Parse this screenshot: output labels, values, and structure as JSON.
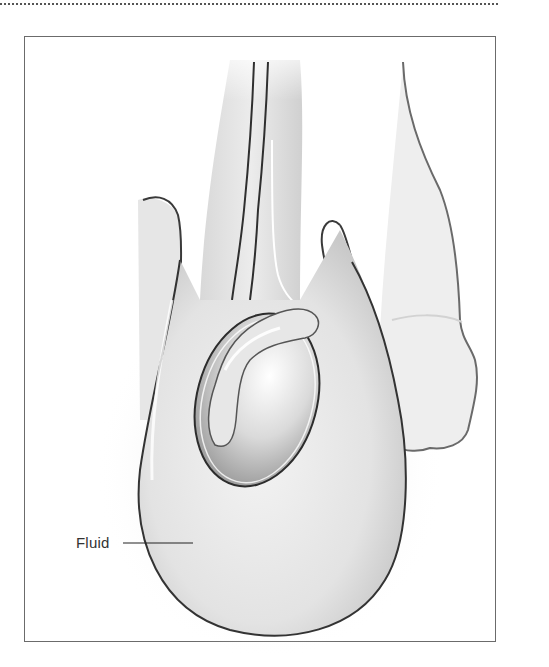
{
  "figure": {
    "type": "medical-illustration",
    "labels": [
      {
        "text": "Fluid",
        "x": 76,
        "y": 535,
        "leader": {
          "x1": 123,
          "y1": 543,
          "x2": 193,
          "y2": 543
        }
      }
    ],
    "colors": {
      "outline": "#3a3a3a",
      "shade": "#c8c8c8",
      "highlight": "#f6f6f6",
      "frame": "#6b6b6b"
    }
  }
}
